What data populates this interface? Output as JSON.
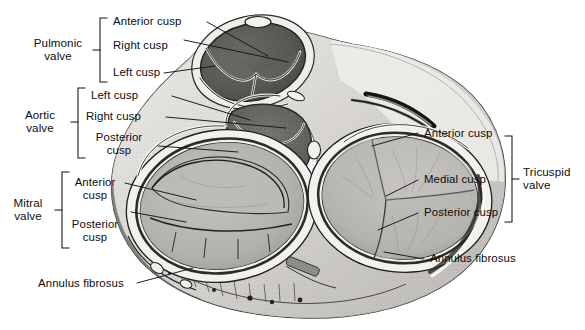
{
  "figure": {
    "ink_color": "#111111",
    "paper_color": "#ffffff"
  },
  "groups": [
    {
      "id": "pulmonic",
      "label_line1": "Pulmonic",
      "label_line2": "valve"
    },
    {
      "id": "aortic",
      "label_line1": "Aortic",
      "label_line2": "valve"
    },
    {
      "id": "mitral",
      "label_line1": "Mitral",
      "label_line2": "valve"
    },
    {
      "id": "tricuspid",
      "label_line1": "Tricuspid",
      "label_line2": "valve"
    }
  ],
  "labels": {
    "pulmonic_anterior": "Anterior cusp",
    "pulmonic_right": "Right cusp",
    "pulmonic_left": "Left cusp",
    "aortic_left": "Left cusp",
    "aortic_right": "Right cusp",
    "aortic_posterior_l1": "Posterior",
    "aortic_posterior_l2": "cusp",
    "mitral_anterior_l1": "Anterior",
    "mitral_anterior_l2": "cusp",
    "mitral_posterior_l1": "Posterior",
    "mitral_posterior_l2": "cusp",
    "tricuspid_anterior": "Anterior cusp",
    "tricuspid_medial": "Medial cusp",
    "tricuspid_posterior": "Posterior cusp",
    "annulus_left": "Annulus fibrosus",
    "annulus_right": "Annulus fibrosus"
  },
  "anatomy": {
    "regions": [
      "pulmonary-trunk-orifice",
      "aortic-valve-orifice",
      "mitral-valve-orifice",
      "tricuspid-valve-orifice",
      "annulus-fibrosus-ring",
      "myocardium-section"
    ]
  }
}
